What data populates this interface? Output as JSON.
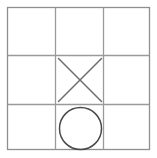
{
  "app": {
    "title": "Tic-Tac-Toe Board"
  },
  "board": {
    "rows": 3,
    "cols": 3,
    "origin_x": 7.5,
    "origin_y": 7.5,
    "size": 142,
    "grid_color": "#9a9a9a",
    "border_color": "#8f8f8f",
    "grid_line_width": 1.3,
    "background": "#ffffff",
    "cells": [
      {
        "id": "cell-0-0",
        "row": 0,
        "col": 0,
        "mark": ""
      },
      {
        "id": "cell-0-1",
        "row": 0,
        "col": 1,
        "mark": ""
      },
      {
        "id": "cell-0-2",
        "row": 0,
        "col": 2,
        "mark": ""
      },
      {
        "id": "cell-1-0",
        "row": 1,
        "col": 0,
        "mark": ""
      },
      {
        "id": "cell-1-1",
        "row": 1,
        "col": 1,
        "mark": "X"
      },
      {
        "id": "cell-1-2",
        "row": 1,
        "col": 2,
        "mark": ""
      },
      {
        "id": "cell-2-0",
        "row": 2,
        "col": 0,
        "mark": ""
      },
      {
        "id": "cell-2-1",
        "row": 2,
        "col": 1,
        "mark": "O"
      },
      {
        "id": "cell-2-2",
        "row": 2,
        "col": 2,
        "mark": ""
      }
    ]
  },
  "marks": {
    "x": {
      "label": "X",
      "cell": "cell-1-1",
      "color": "#6d6d6d",
      "stroke_width": 1.5,
      "x1": 58.5,
      "y1": 58.5,
      "x2": 101.5,
      "y2": 101.5,
      "x3": 101.5,
      "y3": 58.5,
      "x4": 58.5,
      "y4": 101.5
    },
    "o": {
      "label": "O",
      "cell": "cell-2-1",
      "color": "#4a4a4a",
      "stroke_width": 1.5,
      "cx": 80.5,
      "cy": 128.5,
      "r": 21
    }
  },
  "chart_data": {
    "type": "table",
    "categories": [
      "col 1",
      "col 2",
      "col 3"
    ],
    "rows": [
      [
        "",
        "",
        ""
      ],
      [
        "",
        "X",
        ""
      ],
      [
        "",
        "O",
        ""
      ]
    ]
  }
}
